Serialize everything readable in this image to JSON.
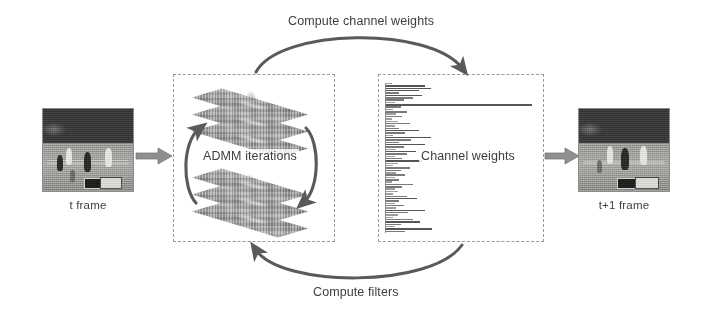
{
  "diagram": {
    "background_color": "#ffffff",
    "line_color": "#5a5a5a",
    "dash_color": "#9a9a9a"
  },
  "input_frame": {
    "caption": "t frame",
    "image_name": "basketball-court-frame-t"
  },
  "output_frame": {
    "caption": "t+1 frame",
    "image_name": "basketball-court-frame-t-plus-1"
  },
  "admm_box": {
    "label": "ADMM iterations",
    "cycle_arrow_left_name": "admm-cycle-arrow-left",
    "cycle_arrow_right_name": "admm-cycle-arrow-right",
    "plane_count_top": 3,
    "plane_count_bottom": 3
  },
  "channel_box": {
    "label": "Channel weights",
    "chart_name": "channel-weights-bar-chart"
  },
  "arrows": {
    "top_label": "Compute channel weights",
    "bottom_label": "Compute filters",
    "input_arrow_name": "input-to-admm-arrow",
    "output_arrow_name": "channel-to-output-arrow"
  },
  "chart_data": {
    "type": "bar",
    "orientation": "horizontal",
    "title": "Channel weights",
    "xlabel": "",
    "ylabel": "",
    "grid": false,
    "legend": null,
    "xlim": [
      0,
      100
    ],
    "categories": [
      "ch1",
      "ch2",
      "ch3",
      "ch4",
      "ch5",
      "ch6",
      "ch7",
      "ch8",
      "ch9",
      "ch10",
      "ch11",
      "ch12",
      "ch13",
      "ch14",
      "ch15",
      "ch16",
      "ch17",
      "ch18",
      "ch19",
      "ch20",
      "ch21",
      "ch22",
      "ch23",
      "ch24",
      "ch25",
      "ch26",
      "ch27",
      "ch28",
      "ch29",
      "ch30",
      "ch31",
      "ch32",
      "ch33",
      "ch34",
      "ch35",
      "ch36",
      "ch37",
      "ch38",
      "ch39",
      "ch40",
      "ch41",
      "ch42",
      "ch43",
      "ch44",
      "ch45",
      "ch46",
      "ch47",
      "ch48",
      "ch49",
      "ch50",
      "ch51",
      "ch52",
      "ch53",
      "ch54",
      "ch55",
      "ch56",
      "ch57",
      "ch58",
      "ch59",
      "ch60",
      "ch61",
      "ch62",
      "ch63",
      "ch64"
    ],
    "values": [
      4,
      26,
      30,
      22,
      9,
      24,
      18,
      12,
      6,
      98,
      10,
      5,
      14,
      7,
      11,
      4,
      8,
      16,
      6,
      9,
      22,
      13,
      5,
      30,
      17,
      9,
      26,
      12,
      7,
      20,
      14,
      6,
      11,
      24,
      8,
      5,
      16,
      10,
      7,
      13,
      6,
      9,
      4,
      18,
      11,
      6,
      8,
      5,
      14,
      21,
      9,
      6,
      12,
      7,
      26,
      15,
      8,
      5,
      18,
      23,
      10,
      6,
      31,
      13
    ],
    "max_value": 98,
    "bar_color": "#555555"
  }
}
